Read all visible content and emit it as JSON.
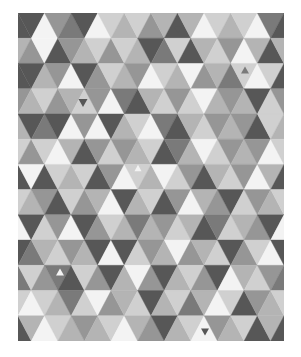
{
  "image": {
    "title": "Grayscale triangle mosaic",
    "description": "Geometric pattern of equilateral triangles in shades of gray"
  },
  "mosaic": {
    "origin": [
      18,
      13
    ],
    "width": 266,
    "height": 328,
    "rows": 13,
    "triangle_width": 26.6,
    "palette": {
      "D": "#575757",
      "G": "#7a7a7a",
      "M": "#969696",
      "L": "#b4b4b4",
      "P": "#d0d0d0",
      "W": "#f3f3f3"
    },
    "grid": [
      "DWMGDWPLPMLDLWPLPWGD",
      "MWDMLPMPLDGPDLPMWLDL",
      "DLMWDMPLMWPLWMLGPWPD",
      "LPMLPMWGDLPMPWLMLDPM",
      "DGDWMWDLPWGDLPMLMDPL",
      "MPWLDMPMLPDGLWPMLMWP",
      "WDPLPDMWPLWPMDLPMWLD",
      "LMDPMLWDLPDMWLMDPMLP",
      "DPMWDMPLGLMPLDGPLMDW",
      "GLPMLDWDPMLWMLPDMPWD",
      "PMGDPMDLWMDLPMDWLPMG",
      "WPLGPWMLPDLPGLWPDMLP",
      "LWPLMLPWLMDLPWMLPDLD"
    ],
    "mini_triangles": [
      {
        "cx": 83,
        "cy": 103,
        "size": 9,
        "color": "D",
        "dir": "down"
      },
      {
        "cx": 178,
        "cy": 30,
        "size": 8,
        "color": "D",
        "dir": "down"
      },
      {
        "cx": 245,
        "cy": 70,
        "size": 8,
        "color": "G",
        "dir": "up"
      },
      {
        "cx": 138,
        "cy": 168,
        "size": 7,
        "color": "W",
        "dir": "up"
      },
      {
        "cx": 60,
        "cy": 272,
        "size": 8,
        "color": "W",
        "dir": "up"
      },
      {
        "cx": 205,
        "cy": 332,
        "size": 8,
        "color": "D",
        "dir": "down"
      }
    ]
  }
}
